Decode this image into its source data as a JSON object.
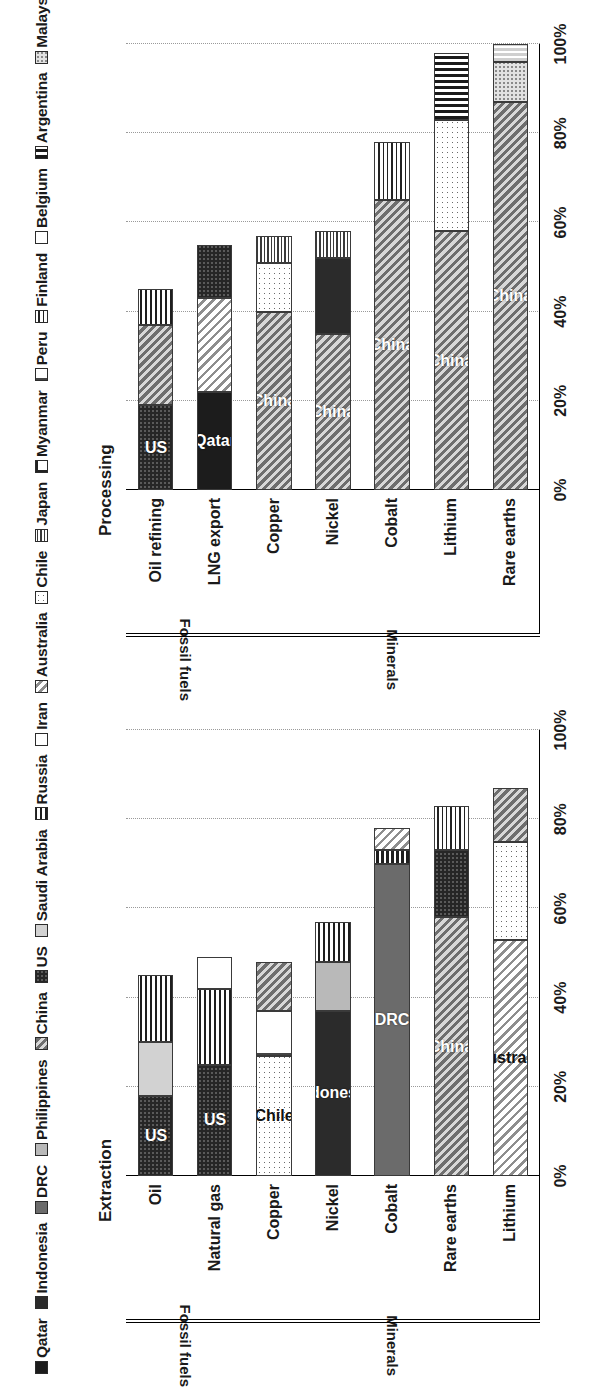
{
  "legend": {
    "items": [
      {
        "label": "Qatar",
        "key": "qatar"
      },
      {
        "label": "Indonesia",
        "key": "indonesia"
      },
      {
        "label": "DRC",
        "key": "drc"
      },
      {
        "label": "Philippines",
        "key": "philippines"
      },
      {
        "label": "China",
        "key": "china"
      },
      {
        "label": "US",
        "key": "us"
      },
      {
        "label": "Saudi Arabia",
        "key": "saudi"
      },
      {
        "label": "Russia",
        "key": "russia"
      },
      {
        "label": "Iran",
        "key": "iran"
      },
      {
        "label": "Australia",
        "key": "australia"
      },
      {
        "label": "Chile",
        "key": "chile"
      },
      {
        "label": "Japan",
        "key": "japan"
      },
      {
        "label": "Myanmar",
        "key": "myanmar"
      },
      {
        "label": "Peru",
        "key": "peru"
      },
      {
        "label": "Finland",
        "key": "finland"
      },
      {
        "label": "Belgium",
        "key": "belgium"
      },
      {
        "label": "Argentina",
        "key": "argentina"
      },
      {
        "label": "Malaysia",
        "key": "malaysia"
      },
      {
        "label": "Estonia",
        "key": "estonia"
      }
    ]
  },
  "axis": {
    "ticks": [
      "0%",
      "20%",
      "40%",
      "60%",
      "80%",
      "100%"
    ],
    "tick_values": [
      0,
      20,
      40,
      60,
      80,
      100
    ],
    "min": 0,
    "max": 100
  },
  "groups": {
    "fossil_fuels": "Fossil fuels",
    "minerals": "Minerals"
  },
  "chart_data": [
    {
      "type": "bar",
      "orientation": "horizontal",
      "stacked": true,
      "title": "Extraction",
      "xlabel": "",
      "ylabel": "",
      "xlim": [
        0,
        100
      ],
      "grid": true,
      "legend_position": "top",
      "categories": [
        "Oil",
        "Natural gas",
        "Copper",
        "Nickel",
        "Cobalt",
        "Rare earths",
        "Lithium"
      ],
      "category_groups": [
        "Fossil fuels",
        "Fossil fuels",
        "Minerals",
        "Minerals",
        "Minerals",
        "Minerals",
        "Minerals"
      ],
      "bars": [
        {
          "category": "Oil",
          "group": "Fossil fuels",
          "total": 45,
          "segments": [
            {
              "country": "US",
              "key": "us",
              "value": 18,
              "label": "US"
            },
            {
              "country": "Saudi Arabia",
              "key": "saudi",
              "value": 12,
              "label": ""
            },
            {
              "country": "Russia",
              "key": "russia",
              "value": 15,
              "label": ""
            }
          ]
        },
        {
          "category": "Natural gas",
          "group": "Fossil fuels",
          "total": 49,
          "segments": [
            {
              "country": "US",
              "key": "us",
              "value": 25,
              "label": "US"
            },
            {
              "country": "Russia",
              "key": "russia",
              "value": 17,
              "label": ""
            },
            {
              "country": "Iran",
              "key": "iran",
              "value": 7,
              "label": ""
            }
          ]
        },
        {
          "category": "Copper",
          "group": "Minerals",
          "total": 48,
          "segments": [
            {
              "country": "Chile",
              "key": "chile",
              "value": 27,
              "label": "Chile"
            },
            {
              "country": "Peru",
              "key": "peru",
              "value": 10,
              "label": ""
            },
            {
              "country": "China",
              "key": "china",
              "value": 11,
              "label": ""
            }
          ]
        },
        {
          "category": "Nickel",
          "group": "Minerals",
          "total": 57,
          "segments": [
            {
              "country": "Indonesia",
              "key": "indonesia",
              "value": 37,
              "label": "Indonesia"
            },
            {
              "country": "Philippines",
              "key": "philippines",
              "value": 11,
              "label": ""
            },
            {
              "country": "Russia",
              "key": "russia",
              "value": 9,
              "label": ""
            }
          ]
        },
        {
          "category": "Cobalt",
          "group": "Minerals",
          "total": 78,
          "segments": [
            {
              "country": "DRC",
              "key": "drc",
              "value": 70,
              "label": "DRC"
            },
            {
              "country": "Russia",
              "key": "russia",
              "value": 3,
              "label": ""
            },
            {
              "country": "Australia",
              "key": "australia",
              "value": 5,
              "label": ""
            }
          ]
        },
        {
          "category": "Rare earths",
          "group": "Minerals",
          "total": 83,
          "segments": [
            {
              "country": "China",
              "key": "china",
              "value": 58,
              "label": "China"
            },
            {
              "country": "US",
              "key": "us",
              "value": 15,
              "label": ""
            },
            {
              "country": "Finland",
              "key": "finland",
              "value": 10,
              "label": ""
            }
          ]
        },
        {
          "category": "Lithium",
          "group": "Minerals",
          "total": 87,
          "segments": [
            {
              "country": "Australia",
              "key": "australia",
              "value": 53,
              "label": "Australia"
            },
            {
              "country": "Chile",
              "key": "chile",
              "value": 22,
              "label": ""
            },
            {
              "country": "China",
              "key": "china",
              "value": 12,
              "label": ""
            }
          ]
        }
      ]
    },
    {
      "type": "bar",
      "orientation": "horizontal",
      "stacked": true,
      "title": "Processing",
      "xlabel": "",
      "ylabel": "",
      "xlim": [
        0,
        100
      ],
      "grid": true,
      "legend_position": "top",
      "categories": [
        "Oil refining",
        "LNG export",
        "Copper",
        "Nickel",
        "Cobalt",
        "Lithium",
        "Rare earths"
      ],
      "category_groups": [
        "Fossil fuels",
        "Fossil fuels",
        "Minerals",
        "Minerals",
        "Minerals",
        "Minerals",
        "Minerals"
      ],
      "bars": [
        {
          "category": "Oil refining",
          "group": "Fossil fuels",
          "total": 45,
          "segments": [
            {
              "country": "US",
              "key": "us",
              "value": 19,
              "label": "US"
            },
            {
              "country": "China",
              "key": "china",
              "value": 18,
              "label": ""
            },
            {
              "country": "Russia",
              "key": "russia",
              "value": 8,
              "label": ""
            }
          ]
        },
        {
          "category": "LNG export",
          "group": "Fossil fuels",
          "total": 55,
          "segments": [
            {
              "country": "Qatar",
              "key": "qatar",
              "value": 22,
              "label": "Qatar"
            },
            {
              "country": "Australia",
              "key": "australia",
              "value": 21,
              "label": ""
            },
            {
              "country": "US",
              "key": "us",
              "value": 12,
              "label": ""
            }
          ]
        },
        {
          "category": "Copper",
          "group": "Minerals",
          "total": 57,
          "segments": [
            {
              "country": "China",
              "key": "china",
              "value": 40,
              "label": "China"
            },
            {
              "country": "Chile",
              "key": "chile",
              "value": 11,
              "label": ""
            },
            {
              "country": "Japan",
              "key": "japan",
              "value": 6,
              "label": ""
            }
          ]
        },
        {
          "category": "Nickel",
          "group": "Minerals",
          "total": 58,
          "segments": [
            {
              "country": "China",
              "key": "china",
              "value": 35,
              "label": "China"
            },
            {
              "country": "Indonesia",
              "key": "indonesia",
              "value": 17,
              "label": ""
            },
            {
              "country": "Japan",
              "key": "japan",
              "value": 6,
              "label": ""
            }
          ]
        },
        {
          "category": "Cobalt",
          "group": "Minerals",
          "total": 78,
          "segments": [
            {
              "country": "China",
              "key": "china",
              "value": 65,
              "label": "China"
            },
            {
              "country": "Finland",
              "key": "finland",
              "value": 13,
              "label": ""
            }
          ]
        },
        {
          "category": "Lithium",
          "group": "Minerals",
          "total": 98,
          "segments": [
            {
              "country": "China",
              "key": "china",
              "value": 58,
              "label": "China"
            },
            {
              "country": "Chile",
              "key": "chile",
              "value": 25,
              "label": ""
            },
            {
              "country": "Argentina",
              "key": "argentina",
              "value": 15,
              "label": ""
            }
          ]
        },
        {
          "category": "Rare earths",
          "group": "Minerals",
          "total": 100,
          "segments": [
            {
              "country": "China",
              "key": "china",
              "value": 87,
              "label": "China"
            },
            {
              "country": "Malaysia",
              "key": "malaysia",
              "value": 9,
              "label": ""
            },
            {
              "country": "Estonia",
              "key": "estonia",
              "value": 4,
              "label": ""
            }
          ]
        }
      ]
    }
  ]
}
